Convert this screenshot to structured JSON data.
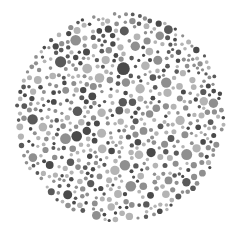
{
  "image": {
    "subject": "Color vision test plate (dot pattern)",
    "style": "grayscale",
    "palette": {
      "background": "#ffffff",
      "dot_light": "#b4b4b4",
      "dot_mid": "#8f8f8f",
      "dot_dark": "#5a5a5a",
      "dot_darker": "#4a4a4a"
    }
  }
}
